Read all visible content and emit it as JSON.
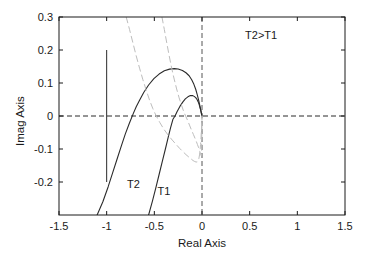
{
  "chart_data": {
    "type": "line",
    "title": "",
    "xlabel": "Real Axis",
    "ylabel": "Imag Axis",
    "xlim": [
      -1.5,
      1.5
    ],
    "ylim": [
      -0.3,
      0.3
    ],
    "grid": false,
    "legend": "none",
    "xticks": [
      "-1.5",
      "-1",
      "-0.5",
      "0",
      "0.5",
      "1",
      "1.5"
    ],
    "xtick_values": [
      -1.5,
      -1,
      -0.5,
      0,
      0.5,
      1,
      1.5
    ],
    "yticks": [
      "0.3",
      "0.2",
      "0.1",
      "0",
      "-0.1",
      "-0.2"
    ],
    "ytick_values": [
      0.3,
      0.2,
      0.1,
      0,
      -0.1,
      -0.2
    ],
    "annotations": [
      {
        "text": "T2>T1",
        "x": 0.62,
        "y": 0.245
      },
      {
        "text": "T2",
        "x": -0.72,
        "y": -0.205
      },
      {
        "text": "T1",
        "x": -0.4,
        "y": -0.228
      }
    ],
    "series": [
      {
        "name": "T2",
        "style": "solid",
        "color": "#2b2b2b",
        "comment": "Nyquist contour, larger loop; crosses real axis near -0.66, peak imag 0.143 near real -0.26, terminates at origin",
        "points": [
          [
            -1.1,
            -0.3
          ],
          [
            -1.04,
            -0.26
          ],
          [
            -0.985,
            -0.215
          ],
          [
            -0.935,
            -0.17
          ],
          [
            -0.888,
            -0.128
          ],
          [
            -0.845,
            -0.09
          ],
          [
            -0.805,
            -0.055
          ],
          [
            -0.762,
            -0.022
          ],
          [
            -0.72,
            0.008
          ],
          [
            -0.69,
            0.028
          ],
          [
            -0.655,
            0.048
          ],
          [
            -0.61,
            0.072
          ],
          [
            -0.56,
            0.094
          ],
          [
            -0.505,
            0.113
          ],
          [
            -0.45,
            0.127
          ],
          [
            -0.395,
            0.137
          ],
          [
            -0.34,
            0.142
          ],
          [
            -0.29,
            0.1435
          ],
          [
            -0.25,
            0.1425
          ],
          [
            -0.205,
            0.138
          ],
          [
            -0.168,
            0.131
          ],
          [
            -0.135,
            0.122
          ],
          [
            -0.108,
            0.11
          ],
          [
            -0.085,
            0.096
          ],
          [
            -0.066,
            0.081
          ],
          [
            -0.05,
            0.065
          ],
          [
            -0.036,
            0.049
          ],
          [
            -0.024,
            0.033
          ],
          [
            -0.014,
            0.019
          ],
          [
            -0.006,
            0.008
          ],
          [
            0.0,
            0.0
          ]
        ]
      },
      {
        "name": "T1",
        "style": "solid",
        "color": "#2b2b2b",
        "comment": "Nyquist contour, smaller loop; crosses real axis near -0.28, peak imag 0.062 near real -0.105, terminates at origin",
        "points": [
          [
            -0.56,
            -0.3
          ],
          [
            -0.52,
            -0.258
          ],
          [
            -0.483,
            -0.216
          ],
          [
            -0.448,
            -0.175
          ],
          [
            -0.415,
            -0.136
          ],
          [
            -0.384,
            -0.1
          ],
          [
            -0.356,
            -0.066
          ],
          [
            -0.33,
            -0.036
          ],
          [
            -0.305,
            -0.01
          ],
          [
            -0.283,
            0.0
          ],
          [
            -0.262,
            0.013
          ],
          [
            -0.232,
            0.029
          ],
          [
            -0.202,
            0.042
          ],
          [
            -0.175,
            0.052
          ],
          [
            -0.148,
            0.058
          ],
          [
            -0.122,
            0.0618
          ],
          [
            -0.1,
            0.062
          ],
          [
            -0.082,
            0.0595
          ],
          [
            -0.066,
            0.0555
          ],
          [
            -0.052,
            0.05
          ],
          [
            -0.041,
            0.0435
          ],
          [
            -0.031,
            0.036
          ],
          [
            -0.023,
            0.028
          ],
          [
            -0.016,
            0.02
          ],
          [
            -0.01,
            0.013
          ],
          [
            -0.005,
            0.006
          ],
          [
            0.0,
            0.0
          ]
        ]
      },
      {
        "name": "T2-conjugate",
        "style": "dashed",
        "color": "#bdbdbd",
        "comment": "mirror/conjugate branch of T2 entering from top of frame",
        "points": [
          [
            -0.795,
            0.3
          ],
          [
            -0.76,
            0.262
          ],
          [
            -0.725,
            0.222
          ],
          [
            -0.69,
            0.182
          ],
          [
            -0.655,
            0.145
          ],
          [
            -0.62,
            0.11
          ],
          [
            -0.585,
            0.078
          ],
          [
            -0.55,
            0.048
          ],
          [
            -0.515,
            0.022
          ],
          [
            -0.48,
            0.0
          ],
          [
            -0.442,
            -0.02
          ],
          [
            -0.4,
            -0.04
          ],
          [
            -0.355,
            -0.058
          ],
          [
            -0.312,
            -0.073
          ],
          [
            -0.272,
            -0.086
          ],
          [
            -0.235,
            -0.098
          ],
          [
            -0.2,
            -0.108
          ],
          [
            -0.168,
            -0.117
          ],
          [
            -0.14,
            -0.124
          ],
          [
            -0.115,
            -0.13
          ],
          [
            -0.094,
            -0.135
          ],
          [
            -0.076,
            -0.138
          ],
          [
            -0.062,
            -0.1395
          ],
          [
            -0.05,
            -0.139
          ],
          [
            -0.04,
            -0.135
          ],
          [
            -0.032,
            -0.128
          ],
          [
            -0.026,
            -0.118
          ],
          [
            -0.02,
            -0.104
          ],
          [
            -0.015,
            -0.086
          ],
          [
            -0.01,
            -0.064
          ],
          [
            -0.006,
            -0.042
          ],
          [
            -0.003,
            -0.02
          ],
          [
            0.0,
            0.0
          ]
        ]
      },
      {
        "name": "T1-conjugate",
        "style": "dashed",
        "color": "#bdbdbd",
        "comment": "mirror/conjugate branch of T1 entering from top of frame",
        "points": [
          [
            -0.42,
            0.3
          ],
          [
            -0.395,
            0.262
          ],
          [
            -0.37,
            0.222
          ],
          [
            -0.344,
            0.182
          ],
          [
            -0.318,
            0.145
          ],
          [
            -0.292,
            0.112
          ],
          [
            -0.266,
            0.082
          ],
          [
            -0.24,
            0.055
          ],
          [
            -0.214,
            0.032
          ],
          [
            -0.19,
            0.012
          ],
          [
            -0.172,
            0.0
          ],
          [
            -0.15,
            -0.014
          ],
          [
            -0.128,
            -0.03
          ],
          [
            -0.108,
            -0.044
          ],
          [
            -0.09,
            -0.056
          ],
          [
            -0.074,
            -0.067
          ],
          [
            -0.06,
            -0.077
          ],
          [
            -0.048,
            -0.086
          ],
          [
            -0.038,
            -0.094
          ],
          [
            -0.03,
            -0.101
          ],
          [
            -0.024,
            -0.107
          ],
          [
            -0.019,
            -0.112
          ],
          [
            -0.015,
            -0.116
          ],
          [
            -0.011,
            -0.119
          ],
          [
            -0.008,
            -0.12
          ],
          [
            -0.006,
            -0.118
          ],
          [
            -0.0045,
            -0.11
          ],
          [
            -0.0035,
            -0.095
          ],
          [
            -0.0025,
            -0.075
          ],
          [
            -0.0015,
            -0.05
          ],
          [
            -0.0007,
            -0.025
          ],
          [
            0.0,
            0.0
          ]
        ]
      }
    ],
    "reference_lines": [
      {
        "name": "critical-point-marker",
        "style": "solid",
        "color": "#2b2b2b",
        "orientation": "vertical",
        "x": -1.0,
        "y_from": 0.2,
        "y_to": -0.2
      },
      {
        "name": "real-axis-zero-line",
        "style": "dashed",
        "color": "#2b2b2b",
        "orientation": "horizontal",
        "y": 0.0
      },
      {
        "name": "imag-axis-zero-line",
        "style": "dashed",
        "color": "#555555",
        "orientation": "vertical",
        "x": 0.0
      }
    ]
  },
  "colors": {
    "frame": "#1a1a1a",
    "solid_curve": "#2b2b2b",
    "dashed_curve": "#bdbdbd",
    "text": "#1a1a1a",
    "background": "#ffffff"
  }
}
